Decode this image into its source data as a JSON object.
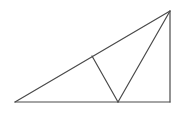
{
  "diagram": {
    "type": "geometry",
    "stroke_color": "#4a4a4a",
    "background": "#ffffff",
    "points": {
      "A": [
        15,
        102
      ],
      "B": [
        170,
        102
      ],
      "C": [
        170,
        11
      ],
      "D": [
        118,
        102
      ],
      "E": [
        92,
        56
      ]
    },
    "segments": [
      {
        "name": "base",
        "from": "A",
        "to": "B"
      },
      {
        "name": "vertical-leg",
        "from": "B",
        "to": "C"
      },
      {
        "name": "hypotenuse",
        "from": "A",
        "to": "C"
      },
      {
        "name": "apex-to-base",
        "from": "C",
        "to": "D"
      },
      {
        "name": "perpendicular-to-hypotenuse",
        "from": "D",
        "to": "E"
      }
    ]
  }
}
